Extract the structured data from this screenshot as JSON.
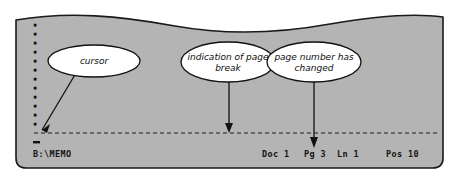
{
  "figure": {
    "name": "word-processor-screen-annotation",
    "panel_color": "#b4b4b4",
    "ink_color": "#111111",
    "balloon_fill": "#ffffff"
  },
  "screen": {
    "left_column_glyph": "▪",
    "left_column_count": 13,
    "cursor_glyph": "_",
    "filename": "B:\\MEMO",
    "status": {
      "doc_label": "Doc 1",
      "page_label": "Pg 3",
      "line_label": "Ln 1",
      "pos_label": "Pos 10"
    },
    "page_break": {
      "name": "page-break-dashed-line",
      "style": "dashed"
    }
  },
  "callouts": [
    {
      "id": "cursor",
      "lines": [
        "cursor"
      ],
      "points_to": "cursor-block"
    },
    {
      "id": "page-break",
      "lines": [
        "indication of page",
        "break"
      ],
      "points_to": "page-break-dashed-line"
    },
    {
      "id": "page-number",
      "lines": [
        "page number has",
        "changed"
      ],
      "points_to": "status-page-label"
    }
  ]
}
